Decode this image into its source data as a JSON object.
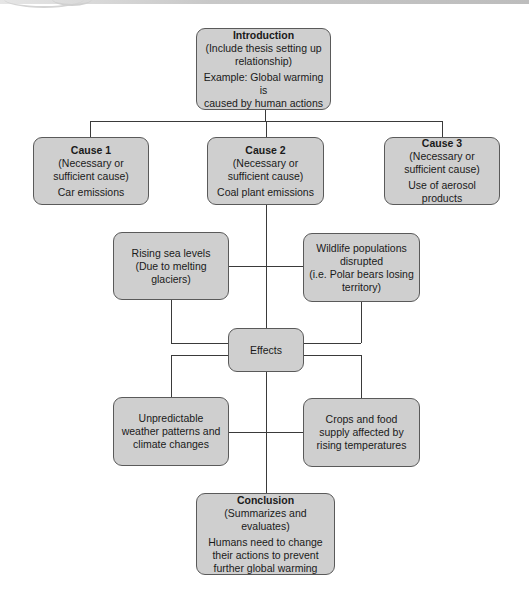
{
  "diagram": {
    "introduction": {
      "title": "Introduction",
      "subtitle_line1": "(Include thesis setting up",
      "subtitle_line2": "relationship)",
      "example_line1": "Example: Global warming is",
      "example_line2": "caused by human actions"
    },
    "causes": [
      {
        "title": "Cause 1",
        "line1": "(Necessary or",
        "line2": "sufficient cause)",
        "detail": "Car emissions"
      },
      {
        "title": "Cause 2",
        "line1": "(Necessary or",
        "line2": "sufficient cause)",
        "detail": "Coal plant emissions"
      },
      {
        "title": "Cause 3",
        "line1": "(Necessary or",
        "line2": "sufficient cause)",
        "detail": "Use of aerosol products"
      }
    ],
    "effects_hub": {
      "label": "Effects"
    },
    "effects": [
      {
        "line1": "Rising sea levels",
        "line2": "(Due to melting",
        "line3": "glaciers)"
      },
      {
        "line1": "Wildlife populations",
        "line2": "disrupted",
        "line3": "(i.e. Polar bears losing",
        "line4": "territory)"
      },
      {
        "line1": "Unpredictable",
        "line2": "weather patterns and",
        "line3": "climate changes"
      },
      {
        "line1": "Crops and food",
        "line2": "supply affected by",
        "line3": "rising temperatures"
      }
    ],
    "conclusion": {
      "title": "Conclusion",
      "subtitle": "(Summarizes and evaluates)",
      "line1": "Humans need to change",
      "line2": "their actions to prevent",
      "line3": "further global warming"
    },
    "colors": {
      "box_fill": "#cfcfcf",
      "box_border": "#5a5a5a",
      "connector": "#3a3a3a"
    }
  }
}
